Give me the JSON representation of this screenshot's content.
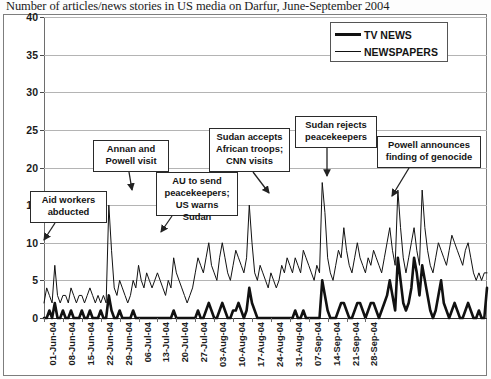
{
  "title": "Number of articles/news stories in US media on Darfur, June-September 2004",
  "legend": {
    "position": "top-right",
    "items": [
      {
        "label": "TV NEWS",
        "style": "thick-black-line",
        "color": "#111111"
      },
      {
        "label": "NEWSPAPERS",
        "style": "thin-black-line",
        "color": "#111111"
      }
    ]
  },
  "annotations": [
    {
      "name": "aid-workers-abducted",
      "text": "Aid workers\nabducted",
      "arrow": "down-left"
    },
    {
      "name": "annan-and-powell-visit",
      "text": "Annan and\nPowell visit",
      "arrow": "down"
    },
    {
      "name": "au-to-send-peacekeepers",
      "text": "AU to send\npeacekeepers;\nUS warns Sudan",
      "arrow": "down-left"
    },
    {
      "name": "sudan-accepts-african-troops",
      "text": "Sudan accepts\nAfrican troops;\nCNN visits",
      "arrow": "down-right"
    },
    {
      "name": "sudan-rejects-peacekeepers",
      "text": "Sudan rejects\npeacekeepers",
      "arrow": "down"
    },
    {
      "name": "powell-announces-genocide",
      "text": "Powell announces\nfinding of genocide",
      "arrow": "down-left"
    }
  ],
  "chart_data": {
    "type": "line",
    "title": "Number of articles/news stories in US media on Darfur, June-September 2004",
    "xlabel": "",
    "ylabel": "",
    "ylim": [
      0,
      40
    ],
    "ytick_step": 5,
    "ytick_labels": [
      "0",
      "5",
      "10",
      "15",
      "20",
      "25",
      "30",
      "35",
      "40"
    ],
    "grid": true,
    "legend_position": "top-right",
    "x_tick_labels": [
      "01-Jun-04",
      "08-Jun-04",
      "15-Jun-04",
      "22-Jun-04",
      "29-Jun-04",
      "06-Jul-04",
      "13-Jul-04",
      "20-Jul-04",
      "27-Jul-04",
      "03-Aug-04",
      "10-Aug-04",
      "17-Aug-04",
      "24-Aug-04",
      "31-Aug-04",
      "07-Sep-04",
      "14-Sep-04",
      "21-Sep-04",
      "28-Sep-04"
    ],
    "x_tick_interval_days": 7,
    "x_start": "01-Jun-04",
    "x_end": "30-Sep-04",
    "series": [
      {
        "name": "NEWSPAPERS",
        "color": "#111111",
        "values": [
          2,
          4,
          3,
          2,
          7,
          3,
          2,
          3,
          3,
          2,
          4,
          3,
          2,
          3,
          3,
          2,
          3,
          4,
          3,
          2,
          3,
          2,
          3,
          2,
          15,
          9,
          4,
          3,
          5,
          4,
          3,
          2,
          3,
          5,
          4,
          7,
          5,
          4,
          6,
          5,
          4,
          5,
          6,
          5,
          4,
          3,
          5,
          4,
          8,
          6,
          5,
          4,
          3,
          2,
          3,
          4,
          6,
          8,
          7,
          6,
          8,
          10,
          7,
          6,
          5,
          8,
          10,
          8,
          6,
          5,
          7,
          9,
          8,
          7,
          6,
          8,
          15,
          10,
          6,
          5,
          7,
          6,
          5,
          4,
          6,
          5,
          4,
          5,
          7,
          6,
          8,
          7,
          6,
          8,
          7,
          6,
          9,
          8,
          7,
          6,
          5,
          7,
          6,
          18,
          14,
          8,
          6,
          5,
          7,
          9,
          8,
          12,
          9,
          7,
          6,
          8,
          10,
          8,
          7,
          6,
          8,
          7,
          9,
          8,
          7,
          6,
          8,
          10,
          12,
          9,
          7,
          17,
          12,
          8,
          6,
          8,
          10,
          12,
          9,
          7,
          17,
          12,
          9,
          7,
          6,
          8,
          10,
          9,
          8,
          7,
          9,
          11,
          10,
          9,
          8,
          7,
          9,
          10,
          8,
          6,
          5,
          6,
          5,
          6,
          6
        ]
      },
      {
        "name": "TV NEWS",
        "color": "#111111",
        "values": [
          0,
          0,
          1,
          0,
          2,
          0,
          0,
          1,
          0,
          0,
          1,
          0,
          0,
          0,
          1,
          0,
          0,
          1,
          0,
          0,
          0,
          1,
          0,
          0,
          3,
          1,
          0,
          0,
          1,
          0,
          0,
          0,
          0,
          1,
          0,
          0,
          0,
          0,
          0,
          0,
          0,
          0,
          0,
          0,
          0,
          0,
          0,
          0,
          1,
          0,
          0,
          0,
          0,
          0,
          0,
          0,
          0,
          1,
          0,
          0,
          1,
          2,
          1,
          0,
          0,
          1,
          2,
          1,
          0,
          0,
          1,
          1,
          2,
          1,
          0,
          1,
          4,
          2,
          1,
          0,
          0,
          0,
          0,
          0,
          0,
          0,
          0,
          0,
          0,
          0,
          0,
          0,
          0,
          1,
          0,
          0,
          1,
          0,
          0,
          0,
          0,
          0,
          0,
          5,
          3,
          1,
          0,
          0,
          0,
          1,
          2,
          2,
          1,
          0,
          0,
          1,
          2,
          2,
          1,
          0,
          1,
          2,
          2,
          1,
          0,
          1,
          2,
          3,
          5,
          3,
          1,
          8,
          5,
          2,
          1,
          2,
          4,
          8,
          6,
          3,
          7,
          5,
          3,
          1,
          0,
          1,
          3,
          5,
          2,
          1,
          0,
          1,
          2,
          1,
          0,
          0,
          1,
          2,
          1,
          0,
          0,
          1,
          0,
          0,
          4
        ]
      }
    ]
  }
}
